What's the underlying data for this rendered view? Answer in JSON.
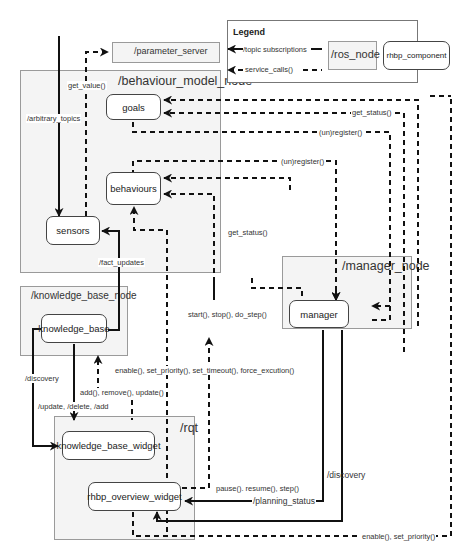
{
  "legend": {
    "title": "Legend",
    "topic_label": "/topic subscriptions",
    "service_label": "service_calls()",
    "ros_node_example": "/ros_node",
    "component_example": "rhbp_component"
  },
  "nodes": {
    "parameter_server": "/parameter_server",
    "behaviour_model_node": "/behaviour_model_node",
    "manager_node": "/manager_node",
    "knowledge_base_node": "/knowledge_base_node",
    "rqt": "/rqt"
  },
  "components": {
    "goals": "goals",
    "behaviours": "behaviours",
    "sensors": "sensors",
    "manager": "manager",
    "knowledge_base": "knowledge_base",
    "knowledge_base_widget": "knowledge_base_widget",
    "rhbp_overview_widget": "rhbp_overview_widget"
  },
  "edges": {
    "get_value": "get_value()",
    "arbitrary_topics": "/arbitrary_topics",
    "get_status_goals": "get_status()",
    "unregister_goals": "(un)register()",
    "unregister_behaviours": "(un)register()",
    "get_status_behaviours": "get_status()",
    "fact_updates": "/fact_updates",
    "start_stop": "start(), stop(), do_step()",
    "enable_set_priority_long": "enable(), set_priority(), set_timeout(), force_excution()",
    "add_remove_update": "add(), remove(), update()",
    "discovery_kb": "/discovery",
    "update_delete_add": "/update, /delete, /add",
    "pause_resume_step": "pause(). resume(), step()",
    "planning_status": "/planning_status",
    "discovery_manager": "/discovery",
    "enable_set_priority_short": "enable(), set_priority()"
  }
}
